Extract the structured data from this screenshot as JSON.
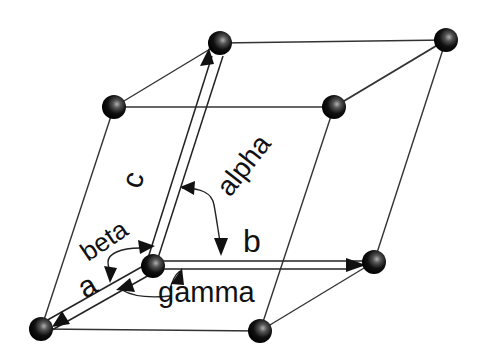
{
  "figure": {
    "labels": {
      "vector_a": "a",
      "vector_b": "b",
      "vector_c": "c",
      "angle_alpha": "alpha",
      "angle_beta": "beta",
      "angle_gamma": "gamma"
    },
    "nodes": [
      {
        "id": "origin",
        "x": 153,
        "y": 266
      },
      {
        "id": "a-end",
        "x": 41,
        "y": 329
      },
      {
        "id": "b-end",
        "x": 374,
        "y": 262
      },
      {
        "id": "c-end",
        "x": 220,
        "y": 43
      },
      {
        "id": "a-plus-b",
        "x": 260,
        "y": 331
      },
      {
        "id": "a-plus-c",
        "x": 114,
        "y": 107
      },
      {
        "id": "b-plus-c",
        "x": 446,
        "y": 40
      },
      {
        "id": "a-plus-b-plus-c",
        "x": 334,
        "y": 107
      }
    ],
    "colors": {
      "background": "#ffffff",
      "line": "#333333",
      "atom": "#000000",
      "atom_highlight": "#9a9a9a"
    }
  }
}
